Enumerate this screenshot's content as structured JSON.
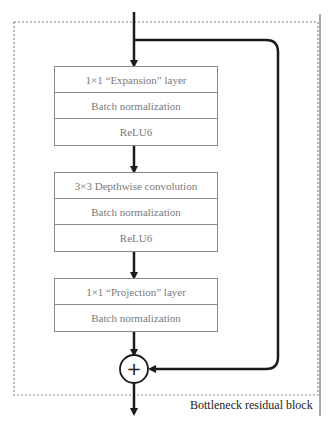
{
  "diagram": {
    "title": "Bottleneck residual block",
    "blocks": [
      {
        "name": "expansion",
        "rows": [
          "1×1 “Expansion” layer",
          "Batch normalization",
          "ReLU6"
        ]
      },
      {
        "name": "depthwise",
        "rows": [
          "3×3 Depthwise convolution",
          "Batch normalization",
          "ReLU6"
        ]
      },
      {
        "name": "projection",
        "rows": [
          "1×1 “Projection” layer",
          "Batch normalization"
        ]
      }
    ],
    "add_symbol": "+",
    "colors": {
      "line": "#1a1a1a",
      "box_border": "#8a8a8a",
      "box_text": "#7a7a7a",
      "dashed": "#888888"
    }
  }
}
